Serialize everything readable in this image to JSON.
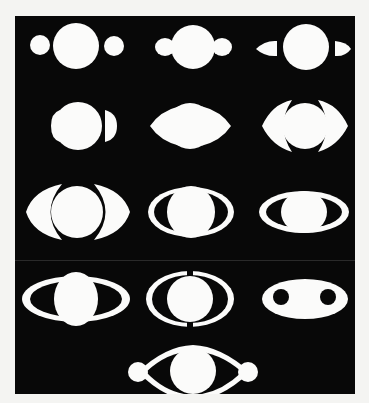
{
  "image": {
    "subject": "Historical drawings of Saturn's appearance (13 figures)",
    "background_color": "#080808",
    "figure_color": "#fbfbfa",
    "page_color": "#f4f4f2"
  },
  "figures": [
    {
      "id": "I",
      "row": 1,
      "col": 1,
      "shape": "sphere with two round companions"
    },
    {
      "id": "II",
      "row": 1,
      "col": 2,
      "shape": "sphere with attached handles"
    },
    {
      "id": "III",
      "row": 1,
      "col": 3,
      "shape": "sphere with two lens-shaped companions"
    },
    {
      "id": "IV",
      "row": 2,
      "col": 1,
      "shape": "sphere with half-moon handles"
    },
    {
      "id": "V",
      "row": 2,
      "col": 2,
      "shape": "sphere with crescent arms"
    },
    {
      "id": "VI",
      "row": 2,
      "col": 3,
      "shape": "sphere with wide crescent arms"
    },
    {
      "id": "VII",
      "row": 3,
      "col": 1,
      "shape": "sphere with large crescent arms"
    },
    {
      "id": "VIII",
      "row": 3,
      "col": 2,
      "shape": "sphere inside elliptical ring"
    },
    {
      "id": "IX",
      "row": 3,
      "col": 3,
      "shape": "flattened elliptical ring"
    },
    {
      "id": "X",
      "row": 4,
      "col": 1,
      "shape": "sphere with long elliptical ring"
    },
    {
      "id": "XI",
      "row": 4,
      "col": 2,
      "shape": "sphere with double arcs"
    },
    {
      "id": "XII",
      "row": 4,
      "col": 3,
      "shape": "ellipse with two dark holes"
    },
    {
      "id": "XIII",
      "row": 5,
      "col": 2,
      "shape": "sphere with connecting arms and end balls"
    }
  ]
}
